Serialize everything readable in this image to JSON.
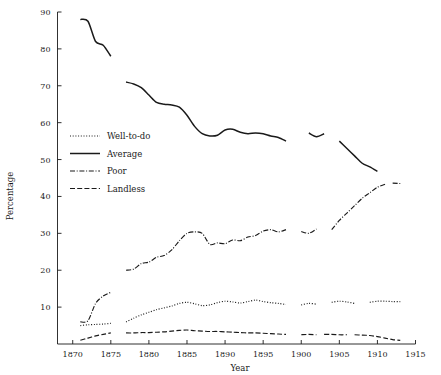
{
  "chart_data": {
    "type": "line",
    "title": "",
    "xlabel": "Year",
    "ylabel": "Percentage",
    "xlim": [
      1868,
      1915
    ],
    "ylim": [
      0,
      90
    ],
    "xticks": [
      1870,
      1875,
      1880,
      1885,
      1890,
      1895,
      1900,
      1905,
      1910,
      1915
    ],
    "yticks": [
      10,
      20,
      30,
      40,
      50,
      60,
      70,
      80,
      90
    ],
    "xtick_labels": [
      "1870",
      "1875",
      "1880",
      "1885",
      "1890",
      "1895",
      "1900",
      "1905",
      "1910",
      "1915"
    ],
    "ytick_labels": [
      "10",
      "20",
      "30",
      "40",
      "50",
      "60",
      "70",
      "80",
      "90"
    ],
    "grid": false,
    "legend_position": "center-left",
    "series": [
      {
        "name": "Well-to-do",
        "style": "dotted",
        "segments": [
          {
            "x": [
              1871,
              1872,
              1873,
              1874,
              1875
            ],
            "y": [
              5.0,
              5.2,
              5.3,
              5.4,
              5.6
            ]
          },
          {
            "x": [
              1877,
              1878,
              1879,
              1880,
              1881,
              1882,
              1883,
              1884,
              1885,
              1886,
              1887,
              1888,
              1889,
              1890,
              1891,
              1892,
              1893,
              1894,
              1895,
              1896,
              1897,
              1898
            ],
            "y": [
              6.0,
              7.0,
              7.9,
              8.6,
              9.3,
              9.8,
              10.3,
              11.0,
              11.3,
              10.9,
              10.4,
              10.6,
              11.2,
              11.6,
              11.4,
              11.1,
              11.5,
              11.9,
              11.5,
              11.2,
              11.0,
              10.7
            ]
          },
          {
            "x": [
              1900,
              1901,
              1902
            ],
            "y": [
              10.6,
              11.0,
              10.8
            ]
          },
          {
            "x": [
              1904,
              1905,
              1906,
              1907
            ],
            "y": [
              11.3,
              11.6,
              11.4,
              11.0
            ]
          },
          {
            "x": [
              1909,
              1910,
              1911,
              1912,
              1913
            ],
            "y": [
              11.3,
              11.6,
              11.6,
              11.5,
              11.5
            ]
          }
        ]
      },
      {
        "name": "Average",
        "style": "solid",
        "segments": [
          {
            "x": [
              1871,
              1872,
              1873,
              1874,
              1875
            ],
            "y": [
              88.0,
              87.5,
              82.0,
              81.0,
              78.0
            ]
          },
          {
            "x": [
              1877,
              1878,
              1879,
              1880,
              1881,
              1882,
              1883,
              1884,
              1885,
              1886,
              1887,
              1888,
              1889,
              1890,
              1891,
              1892,
              1893,
              1894,
              1895,
              1896,
              1897,
              1898
            ],
            "y": [
              71.0,
              70.5,
              69.5,
              67.5,
              65.5,
              65.0,
              64.8,
              64.2,
              62.0,
              59.0,
              57.0,
              56.4,
              56.6,
              58.0,
              58.2,
              57.4,
              57.0,
              57.2,
              57.0,
              56.4,
              56.0,
              55.0
            ]
          },
          {
            "x": [
              1901,
              1902,
              1903
            ],
            "y": [
              57.2,
              56.2,
              57.0
            ]
          },
          {
            "x": [
              1905,
              1906,
              1907,
              1908,
              1909,
              1910
            ],
            "y": [
              55.0,
              53.0,
              51.0,
              49.0,
              48.0,
              46.8
            ]
          }
        ]
      },
      {
        "name": "Poor",
        "style": "dashdot",
        "segments": [
          {
            "x": [
              1871,
              1872,
              1873,
              1874,
              1875
            ],
            "y": [
              6.0,
              6.3,
              11.0,
              13.0,
              14.0
            ]
          },
          {
            "x": [
              1877,
              1878,
              1879,
              1880,
              1881,
              1882,
              1883,
              1884,
              1885,
              1886,
              1887,
              1888,
              1889,
              1890,
              1891,
              1892,
              1893,
              1894,
              1895,
              1896,
              1897,
              1898
            ],
            "y": [
              20.0,
              20.3,
              21.8,
              22.2,
              23.5,
              24.0,
              25.5,
              28.0,
              30.0,
              30.4,
              30.0,
              27.0,
              27.4,
              27.2,
              28.2,
              28.0,
              29.0,
              29.4,
              30.6,
              31.0,
              30.4,
              31.0
            ]
          },
          {
            "x": [
              1900,
              1901,
              1902
            ],
            "y": [
              30.5,
              30.0,
              31.2
            ]
          },
          {
            "x": [
              1904,
              1905,
              1906,
              1907,
              1908,
              1909,
              1910,
              1911
            ],
            "y": [
              31.0,
              33.5,
              35.5,
              37.5,
              39.5,
              41.0,
              42.5,
              43.3
            ]
          },
          {
            "x": [
              1912,
              1913
            ],
            "y": [
              43.6,
              43.5
            ]
          }
        ]
      },
      {
        "name": "Landless",
        "style": "dashed",
        "segments": [
          {
            "x": [
              1871,
              1872,
              1873,
              1874,
              1875
            ],
            "y": [
              1.0,
              1.6,
              2.2,
              2.6,
              3.0
            ]
          },
          {
            "x": [
              1877,
              1878,
              1879,
              1880,
              1881,
              1882,
              1883,
              1884,
              1885,
              1886,
              1887,
              1888,
              1889,
              1890,
              1891,
              1892,
              1893,
              1894,
              1895,
              1896,
              1897,
              1898
            ],
            "y": [
              3.0,
              3.0,
              3.1,
              3.1,
              3.2,
              3.3,
              3.5,
              3.7,
              3.8,
              3.6,
              3.5,
              3.4,
              3.4,
              3.3,
              3.2,
              3.1,
              3.0,
              3.0,
              2.9,
              2.8,
              2.7,
              2.6
            ]
          },
          {
            "x": [
              1900,
              1901,
              1902
            ],
            "y": [
              2.5,
              2.6,
              2.5
            ]
          },
          {
            "x": [
              1903,
              1904,
              1905,
              1906
            ],
            "y": [
              2.6,
              2.6,
              2.5,
              2.5
            ]
          },
          {
            "x": [
              1907,
              1908,
              1909,
              1910,
              1911,
              1912,
              1913
            ],
            "y": [
              2.5,
              2.4,
              2.3,
              2.0,
              1.6,
              1.2,
              1.0
            ]
          }
        ]
      }
    ],
    "legend": [
      {
        "label": "Well-to-do",
        "style": "dotted"
      },
      {
        "label": "Average",
        "style": "solid"
      },
      {
        "label": "Poor",
        "style": "dashdot"
      },
      {
        "label": "Landless",
        "style": "dashed"
      }
    ],
    "colors": {
      "ink": "#1a1a1a",
      "background": "#ffffff"
    }
  }
}
